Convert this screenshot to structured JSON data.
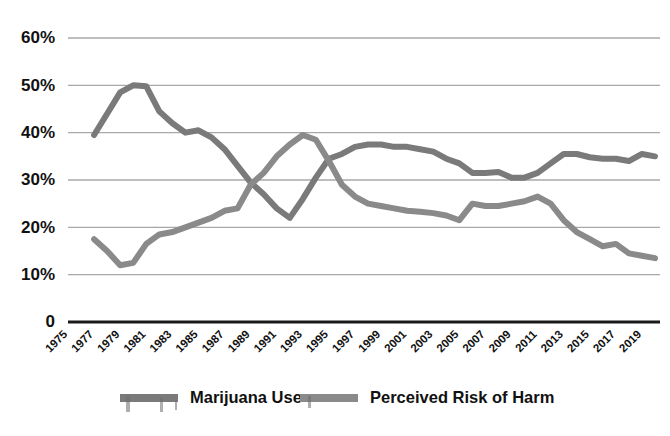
{
  "chart_data": {
    "type": "line",
    "title": "",
    "xlabel": "",
    "ylabel": "",
    "ylim": [
      0,
      60
    ],
    "xlim": [
      1975,
      2020
    ],
    "grid": true,
    "legend_position": "bottom",
    "y_ticks": [
      "0",
      "10%",
      "20%",
      "30%",
      "40%",
      "50%",
      "60%"
    ],
    "y_tick_values": [
      0,
      10,
      20,
      30,
      40,
      50,
      60
    ],
    "x_tick_labels": [
      "1975",
      "1977",
      "1979",
      "1981",
      "1983",
      "1985",
      "1987",
      "1989",
      "1991",
      "1993",
      "1995",
      "1997",
      "1999",
      "2001",
      "2003",
      "2005",
      "2007",
      "2009",
      "2011",
      "2013",
      "2015",
      "2017",
      "2019"
    ],
    "x_tick_values": [
      1975,
      1977,
      1979,
      1981,
      1983,
      1985,
      1987,
      1989,
      1991,
      1993,
      1995,
      1997,
      1999,
      2001,
      2003,
      2005,
      2007,
      2009,
      2011,
      2013,
      2015,
      2017,
      2019
    ],
    "x": [
      1977,
      1978,
      1979,
      1980,
      1981,
      1982,
      1983,
      1984,
      1985,
      1986,
      1987,
      1988,
      1989,
      1990,
      1991,
      1992,
      1993,
      1994,
      1995,
      1996,
      1997,
      1998,
      1999,
      2000,
      2001,
      2002,
      2003,
      2004,
      2005,
      2006,
      2007,
      2008,
      2009,
      2010,
      2011,
      2012,
      2013,
      2014,
      2015,
      2016,
      2017,
      2018,
      2019,
      2020
    ],
    "series": [
      {
        "name": "Marijuana Use",
        "color": "#7a7a7a",
        "values": [
          39.5,
          44.0,
          48.5,
          50.0,
          49.8,
          44.5,
          42.0,
          40.0,
          40.5,
          39.0,
          36.5,
          33.0,
          29.5,
          27.0,
          24.0,
          22.0,
          26.0,
          30.5,
          34.5,
          35.5,
          37.0,
          37.5,
          37.5,
          37.0,
          37.0,
          36.5,
          36.0,
          34.5,
          33.5,
          31.5,
          31.5,
          31.7,
          30.5,
          30.5,
          31.5,
          33.5,
          35.5,
          35.5,
          34.8,
          34.5,
          34.5,
          34.0,
          35.5,
          35.0
        ]
      },
      {
        "name": "Perceived Risk of Harm",
        "color": "#8a8a8a",
        "values": [
          17.5,
          15.0,
          12.0,
          12.5,
          16.5,
          18.5,
          19.0,
          20.0,
          21.0,
          22.0,
          23.5,
          24.0,
          29.0,
          31.5,
          35.0,
          37.5,
          39.5,
          38.5,
          34.0,
          29.0,
          26.5,
          25.0,
          24.5,
          24.0,
          23.5,
          23.3,
          23.0,
          22.5,
          21.5,
          25.0,
          24.5,
          24.5,
          25.0,
          25.5,
          26.5,
          25.0,
          21.5,
          19.0,
          17.5,
          16.0,
          16.5,
          14.5,
          14.0,
          13.5
        ]
      }
    ]
  },
  "legend": {
    "items": [
      {
        "label": "Marijuana Use",
        "color": "#7a7a7a"
      },
      {
        "label": "Perceived Risk of Harm",
        "color": "#8a8a8a"
      }
    ]
  }
}
